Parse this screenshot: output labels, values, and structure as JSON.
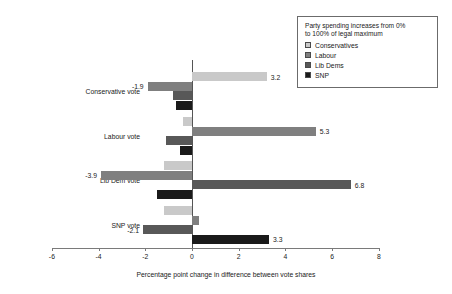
{
  "chart_data": {
    "type": "bar",
    "orientation": "horizontal",
    "grouped": true,
    "title": "",
    "xlabel": "Percentage point change in difference between vote shares",
    "ylabel": "",
    "xlim": [
      -6,
      8
    ],
    "xticks": [
      -6,
      -4,
      -2,
      0,
      2,
      4,
      6,
      8
    ],
    "xtick_labels": [
      "-6",
      "-4",
      "-2",
      "0",
      "2",
      "4",
      "6",
      "8"
    ],
    "grid": false,
    "legend_position": "top-right",
    "legend_title": "Party spending increases from 0% to 100% of legal maximum",
    "categories": [
      "Conservative vote",
      "Labour vote",
      "Lib Dem vote",
      "SNP vote"
    ],
    "series": [
      {
        "name": "Conservatives",
        "color": "#c9c9c9",
        "values": [
          3.2,
          -0.4,
          -1.2,
          -1.2
        ],
        "labels": [
          "3.2",
          "",
          "",
          ""
        ]
      },
      {
        "name": "Labour",
        "color": "#7f7f7f",
        "values": [
          -1.9,
          5.3,
          -3.9,
          0.3
        ],
        "labels": [
          "-1.9",
          "5.3",
          "-3.9",
          ""
        ]
      },
      {
        "name": "Lib Dems",
        "color": "#585858",
        "values": [
          -0.8,
          -1.1,
          6.8,
          -2.1
        ],
        "labels": [
          "",
          "",
          "6.8",
          "-2.1"
        ]
      },
      {
        "name": "SNP",
        "color": "#1a1a1a",
        "values": [
          -0.7,
          -0.5,
          -1.5,
          3.3
        ],
        "labels": [
          "",
          "",
          "",
          "3.3"
        ]
      }
    ]
  },
  "legend": {
    "title_line1": "Party spending increases from 0%",
    "title_line2": "to 100% of legal maximum",
    "items": [
      {
        "label": "Conservatives",
        "color": "#c9c9c9"
      },
      {
        "label": "Labour",
        "color": "#7f7f7f"
      },
      {
        "label": "Lib Dems",
        "color": "#585858"
      },
      {
        "label": "SNP",
        "color": "#1a1a1a"
      }
    ]
  },
  "axis": {
    "title": "Percentage point change in difference between vote shares",
    "ticks": [
      "-6",
      "-4",
      "-2",
      "0",
      "2",
      "4",
      "6",
      "8"
    ]
  }
}
